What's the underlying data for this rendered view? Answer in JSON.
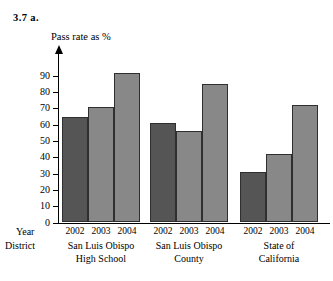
{
  "figure": {
    "label": "3.7  a."
  },
  "chart_data": {
    "type": "bar",
    "title": "",
    "ylabel": "Pass rate as %",
    "xlabel": "",
    "ylim": [
      0,
      95
    ],
    "grid": false,
    "legend": "none",
    "y_ticks": [
      {
        "value": 0,
        "label": "0"
      },
      {
        "value": 10,
        "label": "10"
      },
      {
        "value": 20,
        "label": "20"
      },
      {
        "value": 30,
        "label": "30"
      },
      {
        "value": 40,
        "label": "40"
      },
      {
        "value": 50,
        "label": "50"
      },
      {
        "value": 60,
        "label": "60"
      },
      {
        "value": 70,
        "label": "70"
      },
      {
        "value": 80,
        "label": "80"
      },
      {
        "value": 90,
        "label": "90"
      }
    ],
    "row_headers": {
      "year": "Year",
      "district": "District"
    },
    "categories": [
      "2002",
      "2003",
      "2004"
    ],
    "groups": [
      {
        "name": "San Luis Obispo High School",
        "label_line1": "San Luis Obispo",
        "label_line2": "High School",
        "bars": [
          {
            "category": "2002",
            "value": 65,
            "color": "#555555"
          },
          {
            "category": "2003",
            "value": 71,
            "color": "#888888"
          },
          {
            "category": "2004",
            "value": 92,
            "color": "#888888"
          }
        ]
      },
      {
        "name": "San Luis Obispo County",
        "label_line1": "San Luis Obispo",
        "label_line2": "County",
        "bars": [
          {
            "category": "2002",
            "value": 61,
            "color": "#555555"
          },
          {
            "category": "2003",
            "value": 56,
            "color": "#888888"
          },
          {
            "category": "2004",
            "value": 85,
            "color": "#888888"
          }
        ]
      },
      {
        "name": "State of California",
        "label_line1": "State of",
        "label_line2": "California",
        "bars": [
          {
            "category": "2002",
            "value": 31,
            "color": "#555555"
          },
          {
            "category": "2003",
            "value": 42,
            "color": "#888888"
          },
          {
            "category": "2004",
            "value": 72,
            "color": "#888888"
          }
        ]
      }
    ]
  }
}
